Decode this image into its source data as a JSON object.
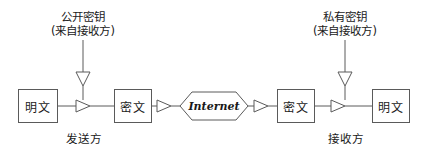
{
  "diagram": {
    "title_colors": {
      "stroke": "#5a5a5a",
      "text": "#1a1a1a",
      "background": "#ffffff"
    },
    "keys": [
      {
        "line1": "公开密钥",
        "line2": "(来自接收方)",
        "arrow_icon": "arrow-down-icon"
      },
      {
        "line1": "私有密钥",
        "line2": "(来自接收方)",
        "arrow_icon": "arrow-down-icon"
      }
    ],
    "nodes": {
      "plaintext_in": "明文",
      "ciphertext_out": "密文",
      "network": "Internet",
      "ciphertext_in": "密文",
      "plaintext_out": "明文"
    },
    "captions": {
      "sender": "发送方",
      "receiver": "接收方"
    },
    "arrow_icons": {
      "flow": "arrow-right-icon",
      "key_drop": "arrow-down-icon"
    }
  }
}
